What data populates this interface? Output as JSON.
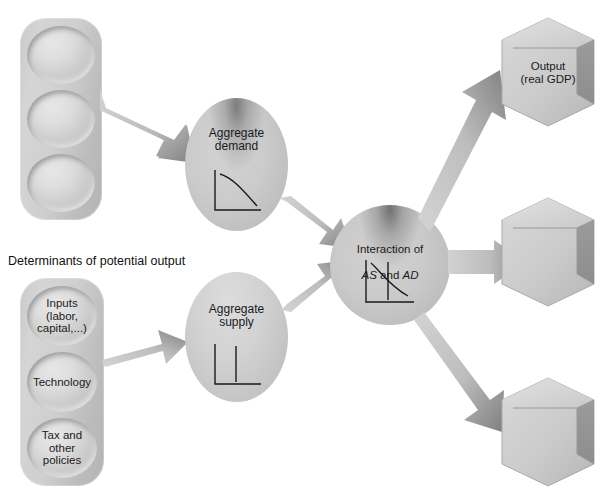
{
  "figure": {
    "caption_determinants": "Determinants of potential output"
  },
  "colors": {
    "background": "#ffffff",
    "shape_light": "#dcdcdc",
    "shape_mid": "#c6c6c6",
    "shape_dark": "#a8a8a8",
    "shape_shadow": "#6e6e6e",
    "arrow_light": "#cfcfcf",
    "arrow_dark": "#8a8a8a",
    "text": "#1a1a1a",
    "chart_line": "#1a1a1a"
  },
  "top_determinants": {
    "caption": "",
    "items": [
      {
        "label": ""
      },
      {
        "label": ""
      },
      {
        "label": ""
      }
    ]
  },
  "bottom_determinants": {
    "caption": "Determinants of potential output",
    "items": [
      {
        "label": "Inputs\n(labor,\ncapital,...)"
      },
      {
        "label": "Technology"
      },
      {
        "label": "Tax and\nother\npolicies"
      }
    ]
  },
  "aggregate_demand": {
    "label": "Aggregate\ndemand",
    "chart": {
      "type": "line",
      "title": "Aggregate demand curve",
      "curve": "downward-sloping convex",
      "xlabel": "",
      "ylabel": ""
    }
  },
  "aggregate_supply": {
    "label": "Aggregate\nsupply",
    "chart": {
      "type": "line",
      "title": "Aggregate supply curve",
      "curve": "vertical",
      "xlabel": "",
      "ylabel": ""
    }
  },
  "interaction": {
    "label_line1": "Interaction of",
    "label_italic_1": "AS",
    "label_joiner": " and ",
    "label_italic_2": "AD",
    "chart": {
      "type": "line",
      "title": "AS and AD intersection",
      "curves": [
        "downward-sloping AD",
        "vertical AS"
      ],
      "xlabel": "",
      "ylabel": ""
    }
  },
  "outputs": [
    {
      "label": "Output\n(real GDP)"
    },
    {
      "label": ""
    },
    {
      "label": ""
    }
  ],
  "arrows": [
    {
      "name": "top-determinants-to-aggregate-demand"
    },
    {
      "name": "bottom-determinants-to-aggregate-supply"
    },
    {
      "name": "aggregate-demand-to-interaction"
    },
    {
      "name": "aggregate-supply-to-interaction"
    },
    {
      "name": "interaction-to-output-top"
    },
    {
      "name": "interaction-to-output-middle"
    },
    {
      "name": "interaction-to-output-bottom"
    }
  ]
}
